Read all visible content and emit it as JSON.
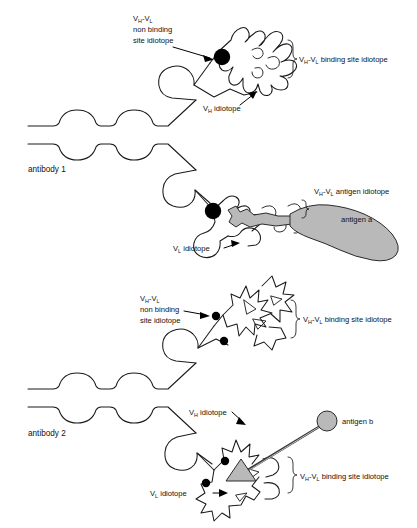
{
  "figure": {
    "background_color": "#ffffff",
    "line_color": "#1a1a1a",
    "antigen_fill_color": "#b9b9b9",
    "idiotope_marker_color": "#000000"
  },
  "panels": [
    {
      "id": "antibody-1",
      "name_label": "antibody 1",
      "labels": {
        "non_binding_line1": "V",
        "non_binding_sub1": "H",
        "non_binding_dash": "-V",
        "non_binding_sub2": "L",
        "non_binding_line2": "non binding",
        "non_binding_line3": "site idiotope",
        "binding_site_prefix": "V",
        "binding_site_sub1": "H",
        "binding_site_mid": "-V",
        "binding_site_sub2": "L",
        "binding_site_suffix": " binding site idiotope",
        "vh_idiotope_prefix": "V",
        "vh_idiotope_sub": "H",
        "vh_idiotope_suffix": " idiotope",
        "vl_idiotope_prefix": "V",
        "vl_idiotope_sub": "L",
        "vl_idiotope_suffix": " idiotope",
        "antigen_idiotope_prefix": "V",
        "antigen_idiotope_sub1": "H",
        "antigen_idiotope_mid": "-V",
        "antigen_idiotope_sub2": "L",
        "antigen_idiotope_suffix": " antigen idiotope",
        "antigen_name": "antigen a"
      }
    },
    {
      "id": "antibody-2",
      "name_label": "antibody 2",
      "labels": {
        "non_binding_line1": "V",
        "non_binding_sub1": "H",
        "non_binding_dash": "-V",
        "non_binding_sub2": "L",
        "non_binding_line2": "non binding",
        "non_binding_line3": "site idiotope",
        "binding_site_upper_prefix": "V",
        "binding_site_upper_sub1": "H",
        "binding_site_upper_mid": "-V",
        "binding_site_upper_sub2": "L",
        "binding_site_upper_suffix": " binding site idiotope",
        "binding_site_lower_prefix": "V",
        "binding_site_lower_sub1": "H",
        "binding_site_lower_mid": "-V",
        "binding_site_lower_sub2": "L",
        "binding_site_lower_suffix": " binding site idiotope",
        "vh_idiotope_prefix": "V",
        "vh_idiotope_sub": "H",
        "vh_idiotope_suffix": " idiotope",
        "vl_idiotope_prefix": "V",
        "vl_idiotope_sub": "L",
        "vl_idiotope_suffix": " idiotope",
        "antigen_name": "antigen b"
      }
    }
  ],
  "diagram_data": {
    "type": "diagram",
    "subject": "immunoglobulin idiotopes and antigen binding",
    "antibody_count": 2,
    "antigens": [
      {
        "name": "antigen a",
        "shape": "irregular blob",
        "binds_to": "antibody 1",
        "fill": "#b9b9b9"
      },
      {
        "name": "antigen b",
        "shape": "triangle hapten on carrier sphere",
        "binds_to": "antibody 2",
        "fill": "#b9b9b9"
      }
    ],
    "idiotope_types": [
      "VH-VL non binding site idiotope",
      "VH-VL binding site idiotope",
      "VH idiotope",
      "VL idiotope",
      "VH-VL antigen idiotope"
    ]
  }
}
